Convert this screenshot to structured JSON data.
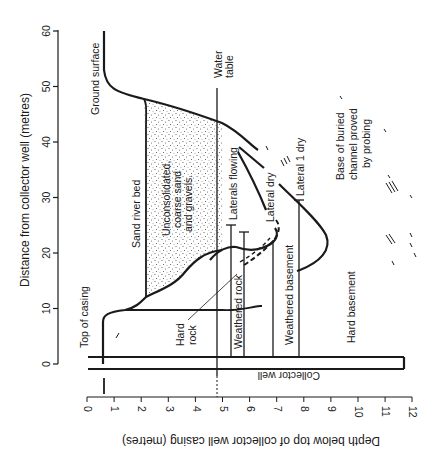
{
  "figure": {
    "colors": {
      "ink": "#1a1a1a",
      "background": "#ffffff",
      "stipple": "#555555"
    },
    "y_axis": {
      "label": "Distance from collector well (metres)",
      "ticks": [
        "0",
        "10",
        "20",
        "30",
        "40",
        "50",
        "60"
      ]
    },
    "x_axis": {
      "label": "Depth below top of collector well casing (metres)",
      "ticks": [
        "0",
        "1",
        "2",
        "3",
        "4",
        "5",
        "6",
        "7",
        "8",
        "9",
        "10",
        "11",
        "12"
      ]
    },
    "labels": {
      "ground_surface": "Ground surface",
      "water_table_1": "Water",
      "water_table_2": "table",
      "sand_river_bed": "Sand river bed",
      "unconsolidated_1": "Unconsolidated,",
      "unconsolidated_2": "coarse sand",
      "unconsolidated_3": "and gravels.",
      "laterals_flowing": "Laterals flowing",
      "lateral_dry": "Lateral dry",
      "lateral_1_dry": "Lateral 1 dry",
      "base_channel_1": "Base of buried",
      "base_channel_2": "channel proved",
      "base_channel_3": "by probing",
      "top_of_casing": "Top of casing",
      "hard_rock_1": "Hard",
      "hard_rock_2": "rock",
      "weathered_rock": "Weathered rock",
      "weathered_basement": "Weathered basement",
      "hard_basement": "Hard basement",
      "collector_well": "Collector well"
    },
    "features": {
      "water_table_depth_m": 4.8,
      "collector_well_depth_m": 11.8,
      "laterals_depths_m": [
        4.8,
        5.3,
        5.8,
        6.9,
        7.9
      ],
      "sand_bed_depth_m": 2.2,
      "ground_surface_top_depth_m": 0.6
    }
  }
}
